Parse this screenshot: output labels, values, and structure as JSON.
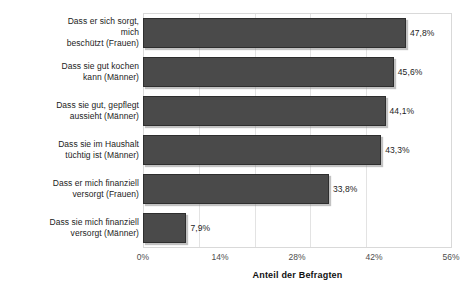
{
  "chart_data": {
    "type": "bar",
    "orientation": "horizontal",
    "title": "",
    "xlabel": "Anteil der Befragten",
    "ylabel": "",
    "xlim": [
      0,
      56
    ],
    "xticks": [
      "0%",
      "14%",
      "28%",
      "42%",
      "56%"
    ],
    "xtick_values": [
      0,
      14,
      28,
      42,
      56
    ],
    "grid": true,
    "legend": false,
    "bar_color": "#4a4a4a",
    "bar_edge_color": "#2e2e2e",
    "categories": [
      "Dass er sich sorgt, mich beschützt (Frauen)",
      "Dass sie gut kochen kann (Männer)",
      "Dass sie gut, gepflegt aussieht (Männer)",
      "Dass sie im Haushalt tüchtig ist (Männer)",
      "Dass er mich finanziell versorgt (Frauen)",
      "Dass sie mich finanziell versorgt (Männer)"
    ],
    "category_lines": [
      [
        "Dass er sich sorgt,",
        "mich",
        "beschützt (Frauen)"
      ],
      [
        "Dass sie gut kochen",
        "kann (Männer)"
      ],
      [
        "Dass sie gut, gepflegt",
        "aussieht (Männer)"
      ],
      [
        "Dass sie im Haushalt",
        "tüchtig ist (Männer)"
      ],
      [
        "Dass er mich finanziell",
        "versorgt (Frauen)"
      ],
      [
        "Dass sie mich finanziell",
        "versorgt (Männer)"
      ]
    ],
    "values": [
      47.8,
      45.6,
      44.1,
      43.3,
      33.8,
      7.9
    ],
    "data_labels": [
      "47,8%",
      "45,6%",
      "44,1%",
      "43,3%",
      "33,8%",
      "7,9%"
    ]
  }
}
